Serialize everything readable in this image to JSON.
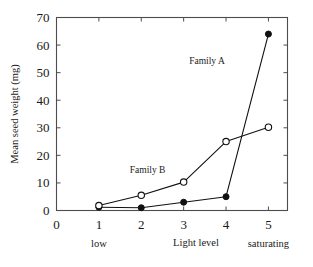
{
  "chart_data": {
    "type": "line",
    "title": "",
    "xlabel": "Light level",
    "ylabel": "Mean seed weight (mg)",
    "x": [
      1,
      2,
      3,
      4,
      5
    ],
    "xlim": [
      0,
      5.45
    ],
    "ylim": [
      0,
      70
    ],
    "xticks": [
      0,
      1,
      2,
      3,
      4,
      5
    ],
    "xticklabels": [
      "0",
      "1",
      "2",
      "3",
      "4",
      "5"
    ],
    "yticks": [
      0,
      10,
      20,
      30,
      40,
      50,
      60,
      70
    ],
    "yticklabels": [
      "0",
      "10",
      "20",
      "30",
      "40",
      "50",
      "60",
      "70"
    ],
    "grid": false,
    "legend_position": "inline-annotations",
    "category_labels": [
      {
        "text": "low",
        "x": 1
      },
      {
        "text": "saturating",
        "x": 5
      }
    ],
    "annotations": [
      {
        "text": "Family A",
        "x": 3.55,
        "y": 53
      },
      {
        "text": "Family B",
        "x": 2.15,
        "y": 13.5
      }
    ],
    "series": [
      {
        "name": "Family A",
        "marker": "filled-circle",
        "values": [
          1.2,
          1.0,
          3.0,
          5.0,
          64.0
        ]
      },
      {
        "name": "Family B",
        "marker": "open-circle",
        "values": [
          1.8,
          5.5,
          10.3,
          25.0,
          30.2
        ]
      }
    ]
  },
  "caption": {
    "partial_text": ""
  }
}
